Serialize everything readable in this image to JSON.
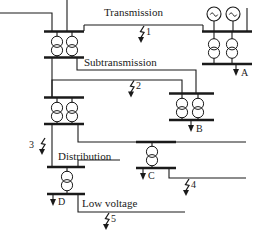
{
  "diagram": {
    "type": "single-line-power-system",
    "stroke_color": "#1a1a1a",
    "background_color": "#ffffff",
    "section_labels": [
      {
        "id": "transmission",
        "text": "Transmission",
        "x": 108,
        "y": 13
      },
      {
        "id": "subtransmission",
        "text": "Subtransmission",
        "x": 88,
        "y": 63
      },
      {
        "id": "distribution",
        "text": "Distribution",
        "x": 62,
        "y": 157
      },
      {
        "id": "low-voltage",
        "text": "Low voltage",
        "x": 84,
        "y": 203
      }
    ],
    "fault_labels": [
      {
        "id": "fault-1",
        "text": "1",
        "x": 148,
        "y": 32
      },
      {
        "id": "fault-2",
        "text": "2",
        "x": 138,
        "y": 87
      },
      {
        "id": "fault-3",
        "text": "3",
        "x": 30,
        "y": 145
      },
      {
        "id": "fault-4",
        "text": "4",
        "x": 193,
        "y": 186
      },
      {
        "id": "fault-5",
        "text": "5",
        "x": 113,
        "y": 224
      }
    ],
    "load_labels": [
      {
        "id": "load-A",
        "text": "A",
        "x": 243,
        "y": 76
      },
      {
        "id": "load-B",
        "text": "B",
        "x": 198,
        "y": 130
      },
      {
        "id": "load-C",
        "text": "C",
        "x": 152,
        "y": 178
      },
      {
        "id": "load-D",
        "text": "D",
        "x": 58,
        "y": 206
      }
    ],
    "components": {
      "generators": [
        {
          "id": "generator-1",
          "cx": 214,
          "cy": 14,
          "r": 7
        },
        {
          "id": "generator-2",
          "cx": 233,
          "cy": 14,
          "r": 7
        }
      ],
      "transformer_banks": [
        {
          "id": "transformer-bank-main-hv",
          "units": 2,
          "x": 57,
          "y": 36
        },
        {
          "id": "transformer-bank-gen-step-up",
          "units": 2,
          "x": 214,
          "y": 43
        },
        {
          "id": "transformer-bank-subtransmission",
          "units": 2,
          "x": 57,
          "y": 104
        },
        {
          "id": "transformer-bank-load-b",
          "units": 2,
          "x": 172,
          "y": 103
        },
        {
          "id": "transformer-distribution-c",
          "units": 1,
          "x": 152,
          "y": 155
        },
        {
          "id": "transformer-distribution-d",
          "units": 1,
          "x": 67,
          "y": 180
        }
      ],
      "buses": [
        {
          "id": "bus-transmission-left",
          "x1": 45,
          "x2": 83,
          "y": 32
        },
        {
          "id": "bus-subtransmission-left",
          "x1": 45,
          "x2": 83,
          "y": 57
        },
        {
          "id": "bus-generation",
          "x1": 203,
          "x2": 248,
          "y": 32
        },
        {
          "id": "bus-load-a",
          "x1": 203,
          "x2": 248,
          "y": 64
        },
        {
          "id": "bus-distribution-left-hv",
          "x1": 45,
          "x2": 83,
          "y": 97
        },
        {
          "id": "bus-distribution-left-lv",
          "x1": 45,
          "x2": 83,
          "y": 124
        },
        {
          "id": "bus-load-b-hv",
          "x1": 170,
          "x2": 213,
          "y": 94
        },
        {
          "id": "bus-load-b-lv",
          "x1": 170,
          "x2": 213,
          "y": 120
        },
        {
          "id": "bus-distribution-c-hv",
          "x1": 137,
          "x2": 175,
          "y": 142
        },
        {
          "id": "bus-distribution-c-lv",
          "x1": 137,
          "x2": 175,
          "y": 168
        },
        {
          "id": "bus-distribution-d-hv",
          "x1": 48,
          "x2": 84,
          "y": 167
        },
        {
          "id": "bus-low-voltage-d",
          "x1": 48,
          "x2": 84,
          "y": 194
        }
      ]
    }
  }
}
